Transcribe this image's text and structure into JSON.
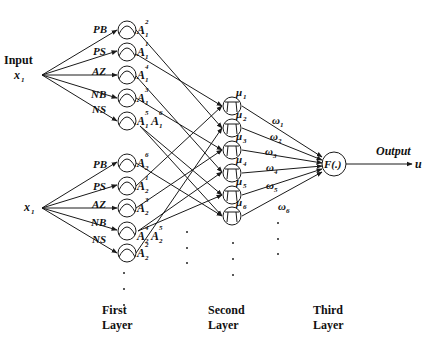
{
  "diagram": {
    "input_label": "Input",
    "input_var_top": "x",
    "input_var_top_sub": "1",
    "input_var_bottom": "x",
    "input_var_bottom_sub": "1",
    "output_label": "Output",
    "output_var": "u",
    "output_node_label": "F(.)",
    "fuzzy_sets_group1": [
      {
        "set": "PB",
        "mf": "A",
        "sup": "2",
        "sub": "1"
      },
      {
        "set": "PS",
        "mf": "A",
        "sup": "1",
        "sub": "1"
      },
      {
        "set": "AZ",
        "mf": "A",
        "sup": "4",
        "sub": "1"
      },
      {
        "set": "NB",
        "mf": "A",
        "sup": "3",
        "sub": "1"
      },
      {
        "set": "NS",
        "mf": "A",
        "sup": "5",
        "sub": "1",
        "extra": "A",
        "extra_sup": "6",
        "extra_sub": "1"
      }
    ],
    "fuzzy_sets_group2": [
      {
        "set": "PB",
        "mf": "A",
        "sup": "6",
        "sub": "2"
      },
      {
        "set": "PS",
        "mf": "A",
        "sup": "1",
        "sub": "2"
      },
      {
        "set": "AZ",
        "mf": "A",
        "sup": "3",
        "sub": "2"
      },
      {
        "set": "NB",
        "mf": "A",
        "sup": "4",
        "sub": "2",
        "extra": "A",
        "extra_sup": "5",
        "extra_sub": "2"
      },
      {
        "set": "NS",
        "mf": "A",
        "sup": "2",
        "sub": "2"
      }
    ],
    "rule_nodes": [
      {
        "label": "μ",
        "sub": "1"
      },
      {
        "label": "μ",
        "sub": "2"
      },
      {
        "label": "μ",
        "sub": "3"
      },
      {
        "label": "μ",
        "sub": "4"
      },
      {
        "label": "μ",
        "sub": "5"
      },
      {
        "label": "μ",
        "sub": "6"
      }
    ],
    "weights": [
      {
        "label": "ω",
        "sub": "1"
      },
      {
        "label": "ω",
        "sub": "2"
      },
      {
        "label": "ω",
        "sub": "3"
      },
      {
        "label": "ω",
        "sub": "4"
      },
      {
        "label": "ω",
        "sub": "5"
      },
      {
        "label": "ω",
        "sub": "6"
      }
    ],
    "layers": [
      {
        "line1": "First",
        "line2": "Layer"
      },
      {
        "line1": "Second",
        "line2": "Layer"
      },
      {
        "line1": "Third",
        "line2": "Layer"
      }
    ]
  }
}
